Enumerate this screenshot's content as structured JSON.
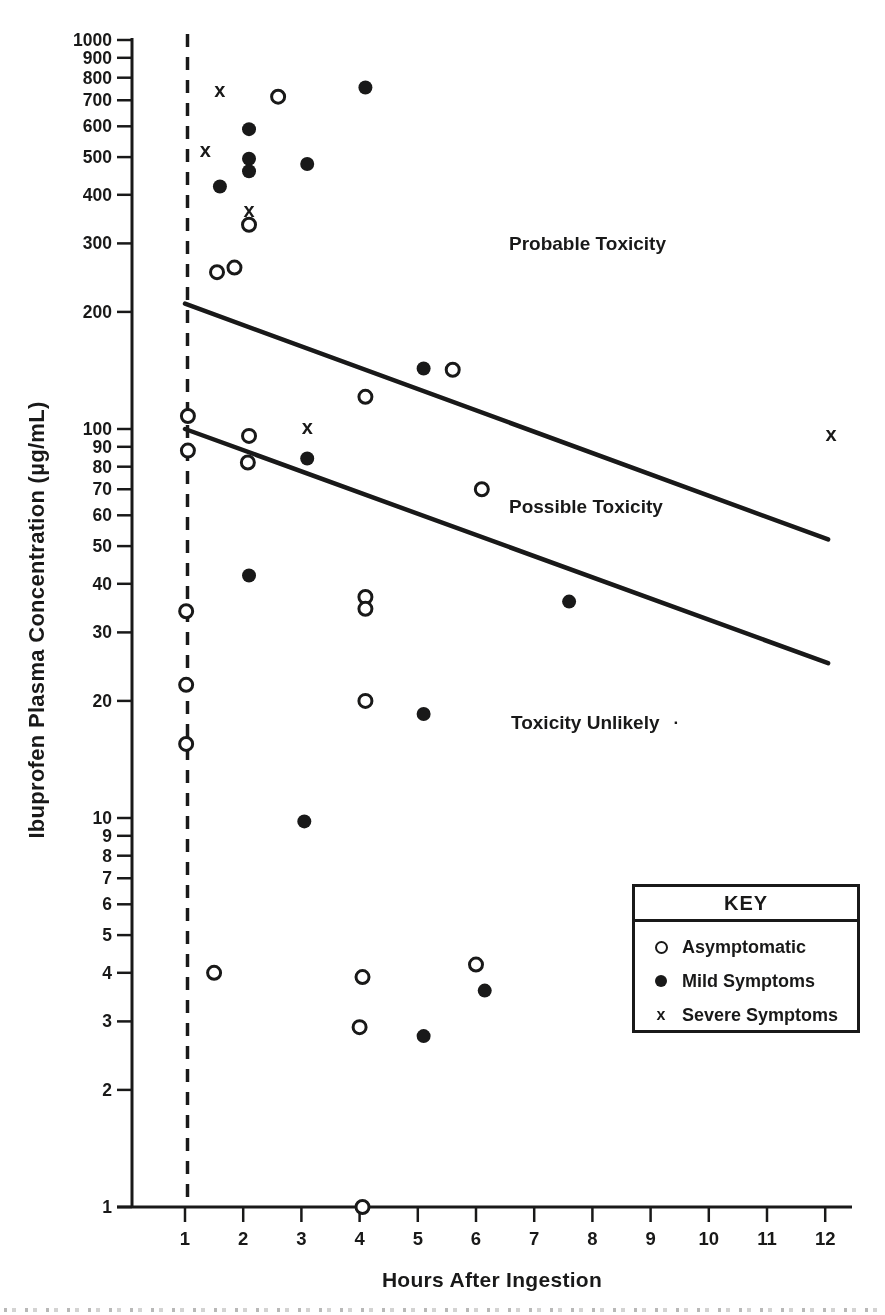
{
  "page": {
    "paper_color": "#fdfdfc",
    "ink_color": "#1d1d1d"
  },
  "legend": {
    "title": "KEY",
    "items": [
      {
        "label": "Asymptomatic"
      },
      {
        "label": "Mild Symptoms"
      },
      {
        "label": "Severe Symptoms"
      }
    ]
  },
  "chart_data": {
    "type": "scatter",
    "title": "",
    "xlabel": "Hours After Ingestion",
    "ylabel": "Ibuprofen Plasma Concentration (µg/mL)",
    "x_scale": "linear",
    "y_scale": "log10",
    "xlim": [
      0.1,
      12.5
    ],
    "ylim": [
      1,
      1000
    ],
    "grid": false,
    "x_ticks": [
      1,
      2,
      3,
      4,
      5,
      6,
      7,
      8,
      9,
      10,
      11,
      12
    ],
    "y_ticks": [
      1000,
      900,
      800,
      700,
      600,
      500,
      400,
      300,
      200,
      100,
      90,
      80,
      70,
      60,
      50,
      40,
      30,
      20,
      10,
      9,
      8,
      7,
      6,
      5,
      4,
      3,
      2,
      1
    ],
    "vertical_dashed_line_at_hour": 1,
    "boundary_lines": [
      {
        "name": "probable-toxicity-boundary",
        "from": [
          1,
          210
        ],
        "to": [
          12.05,
          52
        ]
      },
      {
        "name": "possible-toxicity-boundary",
        "from": [
          1,
          100
        ],
        "to": [
          12.05,
          25
        ]
      }
    ],
    "annotations": [
      {
        "text": "Probable Toxicity",
        "hour": 8.0,
        "value": 300
      },
      {
        "text": "Possible Toxicity",
        "hour": 8.0,
        "value": 63
      },
      {
        "text": "Toxicity Unlikely",
        "hour": 7.9,
        "value": 17.5,
        "stray_mark": "·"
      }
    ],
    "legend_position": "lower right",
    "series": [
      {
        "name": "Asymptomatic",
        "marker": "open-circle",
        "marker_glyph": "○",
        "points": [
          [
            2.6,
            715
          ],
          [
            2.1,
            335
          ],
          [
            1.85,
            260
          ],
          [
            1.55,
            253
          ],
          [
            5.6,
            142
          ],
          [
            4.1,
            121
          ],
          [
            1.05,
            108
          ],
          [
            2.1,
            96
          ],
          [
            1.05,
            88
          ],
          [
            2.08,
            82
          ],
          [
            6.1,
            70
          ],
          [
            4.1,
            37
          ],
          [
            4.1,
            34.5
          ],
          [
            1.02,
            34
          ],
          [
            1.02,
            22
          ],
          [
            4.1,
            20
          ],
          [
            1.02,
            15.5
          ],
          [
            6.0,
            4.2
          ],
          [
            1.5,
            4
          ],
          [
            4.05,
            3.9
          ],
          [
            4.0,
            2.9
          ],
          [
            4.05,
            1
          ]
        ]
      },
      {
        "name": "Mild Symptoms",
        "marker": "filled-circle",
        "marker_glyph": "●",
        "points": [
          [
            4.1,
            755
          ],
          [
            2.1,
            590
          ],
          [
            3.1,
            480
          ],
          [
            2.1,
            495
          ],
          [
            2.1,
            460
          ],
          [
            1.6,
            420
          ],
          [
            5.1,
            143
          ],
          [
            3.1,
            84
          ],
          [
            2.1,
            42
          ],
          [
            7.6,
            36
          ],
          [
            5.1,
            18.5
          ],
          [
            3.05,
            9.8
          ],
          [
            6.15,
            3.6
          ],
          [
            5.1,
            2.75
          ]
        ]
      },
      {
        "name": "Severe Symptoms",
        "marker": "x",
        "marker_glyph": "x",
        "points": [
          [
            1.6,
            740
          ],
          [
            1.35,
            520
          ],
          [
            2.1,
            365
          ],
          [
            3.1,
            101
          ],
          [
            12.1,
            97
          ]
        ]
      }
    ]
  }
}
